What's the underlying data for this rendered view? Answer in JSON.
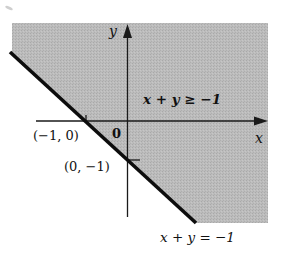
{
  "figure": {
    "type": "inequality-region-graph",
    "colors": {
      "shade": "#b9b9b9",
      "axis": "#1a1a1a",
      "boundary": "#0d0d0d",
      "background": "#ffffff"
    },
    "axes": {
      "x_label": "x",
      "y_label": "y",
      "origin_label": "0"
    },
    "region_label": "x + y ≥ −1",
    "boundary_label": "x + y = −1",
    "points": [
      {
        "label": "(−1, 0)",
        "x": -1,
        "y": 0
      },
      {
        "label": "(0, −1)",
        "x": 0,
        "y": -1
      }
    ],
    "boundary_line": {
      "equation": "x + y = -1",
      "style": "solid-thick"
    },
    "shaded_side": "x + y >= -1"
  }
}
